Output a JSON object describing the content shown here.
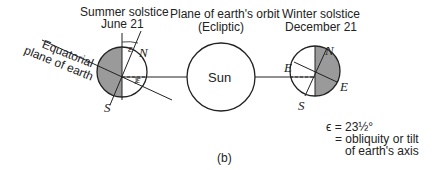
{
  "labels": {
    "summer_title": "Summer solstice",
    "summer_date": "June 21",
    "orbit_title": "Plane of earth's orbit",
    "orbit_sub": "(Ecliptic)",
    "winter_title": "Winter solstice",
    "winter_date": "December 21",
    "equatorial_1": "Equatorial",
    "equatorial_2": "plane of earth",
    "sun": "Sun",
    "north": "N",
    "south": "S",
    "east": "E",
    "epsilon": "ε",
    "legend_line1": "ϵ = 23½°",
    "legend_line2": "= obliquity or tilt",
    "legend_line3": "of earth's axis",
    "caption": "(b)"
  },
  "colors": {
    "shade": "#9a9a9a",
    "line": "#222222"
  }
}
